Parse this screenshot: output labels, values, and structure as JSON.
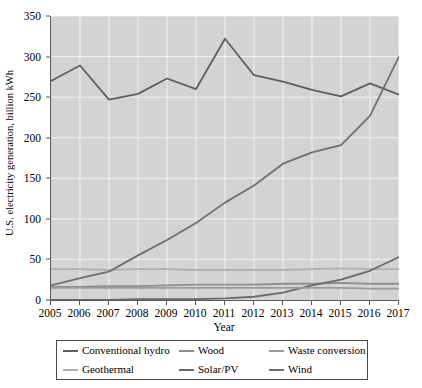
{
  "chart_data": {
    "type": "line",
    "title": "",
    "xlabel": "Year",
    "ylabel": "U.S. electricity generation, billion kWh",
    "x": [
      2005,
      2006,
      2007,
      2008,
      2009,
      2010,
      2011,
      2012,
      2013,
      2014,
      2015,
      2016,
      2017
    ],
    "xtick_labels": [
      "2005",
      "2006",
      "2007",
      "2008",
      "2009",
      "2010",
      "2011",
      "2012",
      "2013",
      "2014",
      "2015",
      "2016",
      "2017"
    ],
    "ytick_labels": [
      "0",
      "50",
      "100",
      "150",
      "200",
      "250",
      "300",
      "350"
    ],
    "ytick_values": [
      0,
      50,
      100,
      150,
      200,
      250,
      300,
      350
    ],
    "ylim": [
      0,
      350
    ],
    "xlim": [
      2005,
      2017
    ],
    "grid": true,
    "legend_position": "below-axes",
    "plot_bgcolor": "#d3d3d3",
    "gridline_color": "#f2f2f2",
    "axis_color": "#5a5a5a",
    "series": [
      {
        "name": "Conventional hydro",
        "color": "#5e5e5e",
        "values": [
          270,
          289,
          247,
          254,
          273,
          260,
          322,
          277,
          269,
          259,
          251,
          267,
          253
        ]
      },
      {
        "name": "Geothermal",
        "color": "#b0b0b0",
        "values": [
          38,
          38,
          37,
          38,
          38,
          37,
          37,
          37,
          37,
          38,
          39,
          38,
          38
        ]
      },
      {
        "name": "Wood",
        "color": "#8e8e8e",
        "values": [
          16,
          16,
          17,
          17,
          18,
          19,
          19,
          19,
          20,
          20,
          21,
          20,
          20
        ]
      },
      {
        "name": "Solar/PV",
        "color": "#6a6a6a",
        "values": [
          0,
          0,
          0,
          1,
          1,
          1,
          2,
          4,
          9,
          18,
          25,
          36,
          53
        ]
      },
      {
        "name": "Waste conversion",
        "color": "#9a9a9a",
        "values": [
          15,
          15,
          15,
          15,
          15,
          15,
          15,
          15,
          15,
          15,
          15,
          14,
          14
        ]
      },
      {
        "name": "Wind",
        "color": "#6f6f6f",
        "values": [
          18,
          27,
          35,
          55,
          74,
          95,
          120,
          141,
          168,
          182,
          191,
          227,
          300
        ]
      }
    ]
  },
  "legend": {
    "items": [
      {
        "label": "Conventional hydro",
        "color": "#5e5e5e"
      },
      {
        "label": "Wood",
        "color": "#8e8e8e"
      },
      {
        "label": "Waste conversion",
        "color": "#9a9a9a"
      },
      {
        "label": "Geothermal",
        "color": "#b0b0b0"
      },
      {
        "label": "Solar/PV",
        "color": "#6a6a6a"
      },
      {
        "label": "Wind",
        "color": "#6f6f6f"
      }
    ]
  }
}
